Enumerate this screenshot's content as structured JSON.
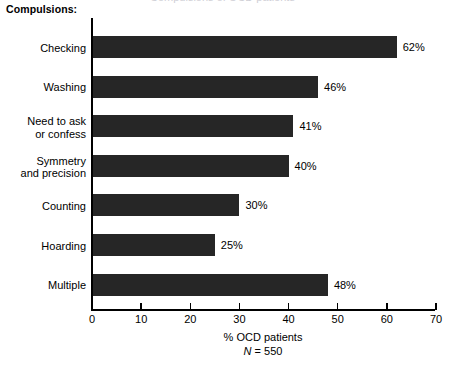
{
  "clipped_title_fragment": "Compulsions of OCD patients",
  "group_heading": "Compulsions:",
  "colors": {
    "bar": "#262626",
    "axis": "#000000",
    "background": "#ffffff",
    "clipped_title": "#cfcfd6"
  },
  "axis": {
    "x_caption_line1": "% OCD patients",
    "x_caption_n_symbol": "N",
    "x_caption_n_rest": " = 550",
    "tick_labels": [
      "0",
      "10",
      "20",
      "30",
      "40",
      "50",
      "60",
      "70"
    ]
  },
  "chart_data": {
    "type": "bar",
    "orientation": "horizontal",
    "title": "Compulsions:",
    "xlabel": "% OCD patients",
    "ylabel": "Compulsions:",
    "annotation": "N = 550",
    "xlim": [
      0,
      70
    ],
    "xticks": [
      0,
      10,
      20,
      30,
      40,
      50,
      60,
      70
    ],
    "grid": false,
    "legend": "none",
    "categories": [
      "Checking",
      "Washing",
      "Need to ask\nor confess",
      "Symmetry\nand precision",
      "Counting",
      "Hoarding",
      "Multiple"
    ],
    "values": [
      62,
      46,
      41,
      40,
      30,
      25,
      48
    ],
    "value_labels": [
      "62%",
      "46%",
      "41%",
      "40%",
      "30%",
      "25%",
      "48%"
    ],
    "bars": [
      {
        "category_line1": "Checking",
        "category_line2": "",
        "value": 62,
        "label": "62%"
      },
      {
        "category_line1": "Washing",
        "category_line2": "",
        "value": 46,
        "label": "46%"
      },
      {
        "category_line1": "Need to ask",
        "category_line2": "or confess",
        "value": 41,
        "label": "41%"
      },
      {
        "category_line1": "Symmetry",
        "category_line2": "and precision",
        "value": 40,
        "label": "40%"
      },
      {
        "category_line1": "Counting",
        "category_line2": "",
        "value": 30,
        "label": "30%"
      },
      {
        "category_line1": "Hoarding",
        "category_line2": "",
        "value": 25,
        "label": "25%"
      },
      {
        "category_line1": "Multiple",
        "category_line2": "",
        "value": 48,
        "label": "48%"
      }
    ]
  }
}
